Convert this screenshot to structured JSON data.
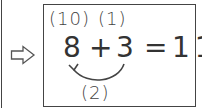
{
  "diagram": {
    "transition_arrow": "hollow-right-arrow",
    "annotations": {
      "above_8": "(10)",
      "above_3": "(1)",
      "below_curve": "(2)"
    },
    "equation": {
      "left_operand": "8",
      "operator": "+",
      "right_operand": "3",
      "equals": "=",
      "result": "11"
    },
    "curved_arrow": {
      "from": "3",
      "to": "8",
      "label": "(2)"
    },
    "colors": {
      "stroke": "#444444",
      "text": "#333333",
      "background": "#ffffff"
    }
  }
}
